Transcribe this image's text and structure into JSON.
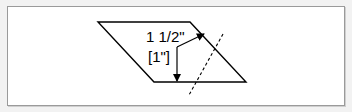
{
  "diagram": {
    "labels": {
      "dimension_primary": "1 1/2\"",
      "dimension_secondary": "[1\"]"
    },
    "shapes": {
      "parallelogram": {
        "points": "98,22 190,22 246,82 154,82",
        "stroke": "#000000"
      },
      "cut_line": {
        "style": "dashed",
        "from": [
          223,
          34
        ],
        "to": [
          189,
          95
        ],
        "stroke": "#000000"
      },
      "measurement_arrow": {
        "vertical": {
          "from": [
            177,
            47
          ],
          "to": [
            177,
            81
          ]
        },
        "diagonal": {
          "from": [
            177,
            47
          ],
          "to": [
            204,
            34
          ]
        }
      }
    },
    "colors": {
      "background": "#ffffff",
      "border": "#9a9a9a",
      "ink": "#000000"
    }
  }
}
